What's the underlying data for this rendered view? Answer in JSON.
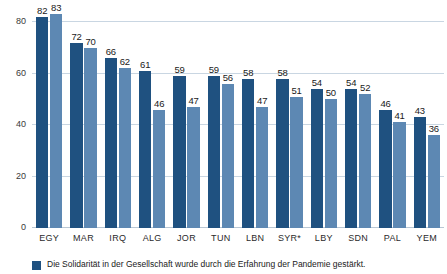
{
  "chart_data": {
    "type": "bar",
    "title": "",
    "subtitle": "",
    "xlabel": "",
    "ylabel": "",
    "ylim": [
      0,
      80
    ],
    "yticks": [
      0,
      20,
      40,
      60,
      80
    ],
    "grid": true,
    "legend_position": "bottom-left",
    "categories": [
      "EGY",
      "MAR",
      "IRQ",
      "ALG",
      "JOR",
      "TUN",
      "LBN",
      "SYR*",
      "LBY",
      "SDN",
      "PAL",
      "YEM"
    ],
    "series": [
      {
        "name": "Die Solidarität in der Gesellschaft wurde durch die Erfahrung der Pandemie gestärkt.",
        "color": "#1f5180",
        "values": [
          82,
          72,
          66,
          61,
          59,
          59,
          58,
          58,
          54,
          54,
          46,
          43
        ]
      },
      {
        "name": "",
        "color": "#5d88b3",
        "values": [
          83,
          70,
          62,
          46,
          47,
          56,
          47,
          51,
          50,
          52,
          41,
          36
        ]
      }
    ]
  },
  "legend": {
    "items": [
      {
        "swatch_color": "#1f5180",
        "label": "Die Solidarität in der Gesellschaft wurde durch die Erfahrung der Pandemie gestärkt."
      }
    ]
  }
}
